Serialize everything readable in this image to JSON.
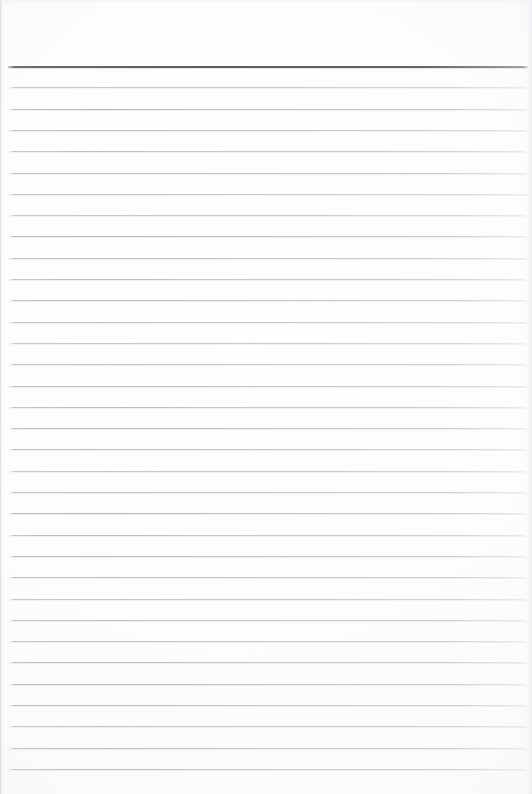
{
  "document": {
    "type": "scanned-ruled-paper",
    "title": "Blank Lined Notepad Page",
    "page_width": 532,
    "page_height": 794,
    "background_color": "#fefefe",
    "content_text": "",
    "is_blank": true
  },
  "rules": {
    "header_rule": {
      "label": "header-rule",
      "y": 66,
      "thickness": 2,
      "color": "#555560",
      "x_start": 8,
      "x_end": 528
    },
    "body_rule_color": "#b4b4bc",
    "body_rule_thickness": 1,
    "x_start": 9,
    "x_end": 527,
    "spacing": 21.3,
    "first_body_rule_y": 87.3,
    "count": 33,
    "positions": [
      87.3,
      108.6,
      129.9,
      151.2,
      172.5,
      193.8,
      215.1,
      236.4,
      257.7,
      279.0,
      300.3,
      321.6,
      342.9,
      364.2,
      385.5,
      406.8,
      428.1,
      449.4,
      470.7,
      492.0,
      513.3,
      534.6,
      555.9,
      577.2,
      598.5,
      619.8,
      641.1,
      662.4,
      683.7,
      705.0,
      726.3,
      747.6,
      768.9
    ]
  },
  "margins": {
    "top_blank_height": 66,
    "bottom_blank_height": 25,
    "left_edge_shadow_width": 3,
    "right_edge_fade_width": 6
  }
}
